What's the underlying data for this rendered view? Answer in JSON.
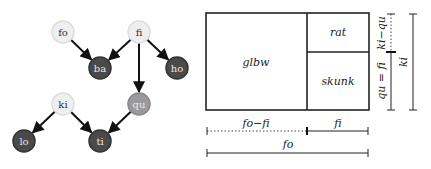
{
  "graph": {
    "nodes": [
      {
        "id": "fo",
        "label": "fo",
        "x": 63,
        "y": 32,
        "fill": "#efefef",
        "stroke": "#dddddd",
        "text": "light"
      },
      {
        "id": "fi",
        "label": "fi",
        "x": 139,
        "y": 32,
        "fill": "#efefef",
        "stroke": "#dddddd",
        "text": "light"
      },
      {
        "id": "ba",
        "label": "ba",
        "x": 100,
        "y": 68,
        "fill": "#4a4a4a",
        "stroke": "#333333",
        "text": "dark"
      },
      {
        "id": "ho",
        "label": "ho",
        "x": 177,
        "y": 68,
        "fill": "#4a4a4a",
        "stroke": "#333333",
        "text": "dark"
      },
      {
        "id": "ki",
        "label": "ki",
        "x": 63,
        "y": 104,
        "fill": "#efefef",
        "stroke": "#dddddd",
        "text": "light"
      },
      {
        "id": "qu",
        "label": "qu",
        "x": 139,
        "y": 104,
        "fill": "#9a9a9a",
        "stroke": "#888888",
        "text": "dark"
      },
      {
        "id": "lo",
        "label": "lo",
        "x": 24,
        "y": 141,
        "fill": "#4a4a4a",
        "stroke": "#333333",
        "text": "dark"
      },
      {
        "id": "ti",
        "label": "ti",
        "x": 100,
        "y": 141,
        "fill": "#4a4a4a",
        "stroke": "#333333",
        "text": "dark"
      }
    ],
    "edges": [
      {
        "from": "fo",
        "to": "ba"
      },
      {
        "from": "fi",
        "to": "ba"
      },
      {
        "from": "fi",
        "to": "ho"
      },
      {
        "from": "fi",
        "to": "qu"
      },
      {
        "from": "ki",
        "to": "lo"
      },
      {
        "from": "ki",
        "to": "ti"
      },
      {
        "from": "qu",
        "to": "ti"
      }
    ]
  },
  "partition": {
    "regions": {
      "left": "glbw",
      "top_right": "rat",
      "bottom_right": "skunk"
    },
    "dimensions": {
      "bottom_left_segment": "fo−fi",
      "bottom_right_segment": "fi",
      "bottom_total": "fo",
      "right_upper_segment": "ki−qu",
      "right_lower_segment": "qu = fi",
      "right_total": "ki"
    }
  }
}
